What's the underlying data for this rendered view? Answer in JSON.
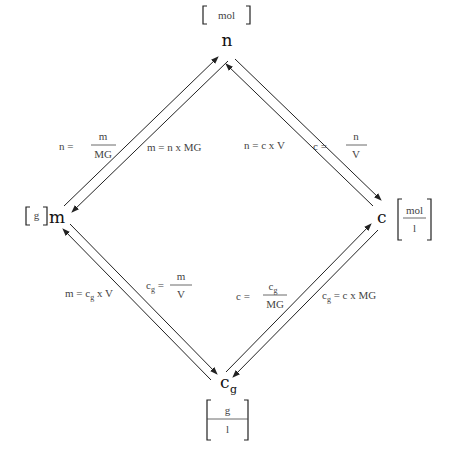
{
  "diagram": {
    "type": "conversion-diamond",
    "nodes": {
      "top": {
        "symbol": "n",
        "unit": "mol"
      },
      "left": {
        "symbol": "m",
        "unit": "g"
      },
      "right": {
        "symbol": "c",
        "unit_num": "mol",
        "unit_den": "l"
      },
      "bottom": {
        "symbol": "c",
        "subscript": "g",
        "unit_num": "g",
        "unit_den": "l"
      }
    },
    "edges": {
      "m_n": {
        "left_formula": {
          "lhs": "n =",
          "num": "m",
          "den": "MG"
        },
        "right_formula": "m = n x MG"
      },
      "n_c": {
        "left_formula": "n = c x V",
        "right_formula": {
          "lhs": "c =",
          "num": "n",
          "den": "V"
        }
      },
      "m_cg": {
        "left_formula": {
          "pre": "m = c",
          "sub": "g",
          "post": " x V"
        },
        "right_formula": {
          "lhs_base": "c",
          "lhs_sub": "g",
          "lhs_eq": " =",
          "num": "m",
          "den": "V"
        }
      },
      "cg_c": {
        "left_formula": {
          "lhs": "c =",
          "num_base": "c",
          "num_sub": "g",
          "den": "MG"
        },
        "right_formula": {
          "lhs_base": "c",
          "lhs_sub": "g",
          "rest": " = c x MG"
        }
      }
    }
  }
}
